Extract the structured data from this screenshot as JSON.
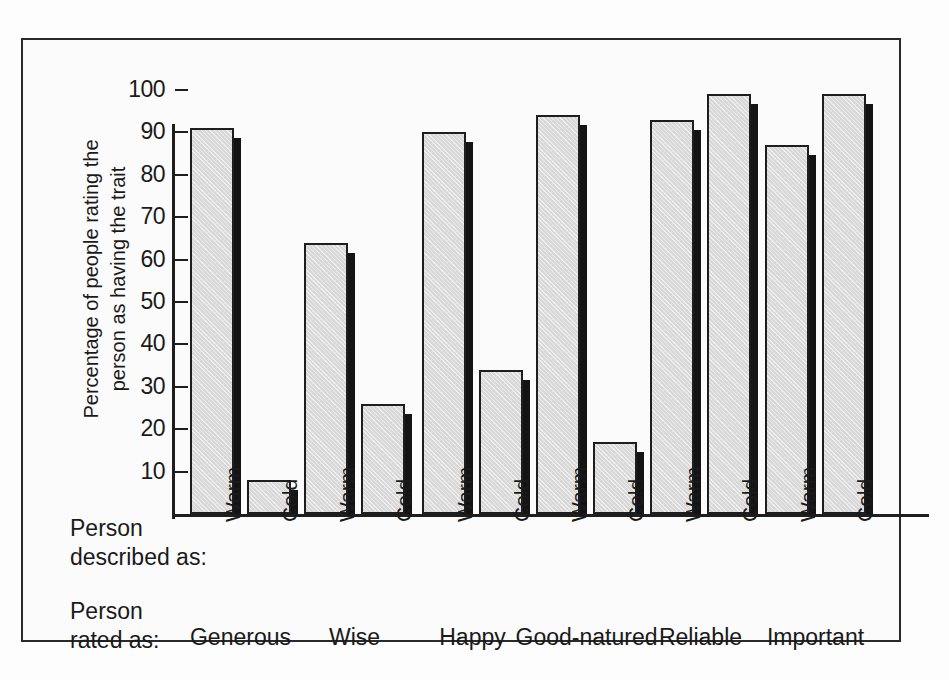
{
  "figure": {
    "background_color": "#fdfdfd",
    "frame_color": "#2a2a2a",
    "bar_fill_color": "#d8d8d8",
    "bar_edge_color": "#1e1e1e",
    "bar_shadow_color": "#141414"
  },
  "captions": {
    "described_line1": "Person",
    "described_line2": "described as:",
    "rated_line1": "Person",
    "rated_line2": "rated as:"
  },
  "chart_data": {
    "type": "bar",
    "title": "",
    "subtitle": "",
    "xlabel": "",
    "ylabel_line1": "Percentage of people rating the",
    "ylabel_line2": "person as having the trait",
    "ylim": [
      0,
      100
    ],
    "yticks": [
      10,
      20,
      30,
      40,
      50,
      60,
      70,
      80,
      90,
      100
    ],
    "ytick_labels": [
      "10",
      "20",
      "30",
      "40",
      "50",
      "60",
      "70",
      "80",
      "90",
      "100"
    ],
    "grid": false,
    "legend_position": "none",
    "categories": [
      "Generous",
      "Wise",
      "Happy",
      "Good-natured",
      "Reliable",
      "Important"
    ],
    "condition_labels": [
      "Warm",
      "Cold"
    ],
    "series": [
      {
        "name": "Warm",
        "values": [
          91,
          64,
          90,
          94,
          93,
          87
        ]
      },
      {
        "name": "Cold",
        "values": [
          8,
          26,
          34,
          17,
          99,
          99
        ]
      }
    ],
    "bars": [
      {
        "trait": "Generous",
        "condition": "Warm",
        "value": 91
      },
      {
        "trait": "Generous",
        "condition": "Cold",
        "value": 8
      },
      {
        "trait": "Wise",
        "condition": "Warm",
        "value": 64
      },
      {
        "trait": "Wise",
        "condition": "Cold",
        "value": 26
      },
      {
        "trait": "Happy",
        "condition": "Warm",
        "value": 90
      },
      {
        "trait": "Happy",
        "condition": "Cold",
        "value": 34
      },
      {
        "trait": "Good-natured",
        "condition": "Warm",
        "value": 94
      },
      {
        "trait": "Good-natured",
        "condition": "Cold",
        "value": 17
      },
      {
        "trait": "Reliable",
        "condition": "Warm",
        "value": 93
      },
      {
        "trait": "Reliable",
        "condition": "Cold",
        "value": 99
      },
      {
        "trait": "Important",
        "condition": "Warm",
        "value": 87
      },
      {
        "trait": "Important",
        "condition": "Cold",
        "value": 99
      }
    ]
  }
}
